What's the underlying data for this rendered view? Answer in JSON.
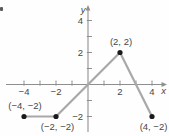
{
  "figure": {
    "description_label": "piecewise linear graph on coordinate plane"
  },
  "chart_data": {
    "type": "line",
    "title": "",
    "xlabel": "x",
    "ylabel": "y",
    "xlim": [
      -5,
      5
    ],
    "ylim": [
      -3.2,
      5
    ],
    "grid": false,
    "legend": false,
    "x_ticks": [
      -4,
      -3,
      -2,
      -1,
      1,
      2,
      3,
      4
    ],
    "y_ticks": [
      -2,
      -1,
      1,
      2,
      3,
      4
    ],
    "x_tick_labels": [
      {
        "v": -4,
        "t": "−4"
      },
      {
        "v": -2,
        "t": "−2"
      },
      {
        "v": 2,
        "t": "2"
      },
      {
        "v": 4,
        "t": "4"
      }
    ],
    "y_tick_labels": [
      {
        "v": 4,
        "t": "4"
      },
      {
        "v": 2,
        "t": "2"
      },
      {
        "v": -2,
        "t": "−2"
      }
    ],
    "series": [
      {
        "name": "piecewise-line",
        "x": [
          -4,
          -2,
          2,
          4
        ],
        "y": [
          -2,
          -2,
          2,
          -2
        ]
      }
    ],
    "points": [
      {
        "x": -4,
        "y": -2,
        "label": "(−4, −2)",
        "label_pos": "above"
      },
      {
        "x": -2,
        "y": -2,
        "label": "(−2, −2)",
        "label_pos": "below"
      },
      {
        "x": 2,
        "y": 2,
        "label": "(2, 2)",
        "label_pos": "above"
      },
      {
        "x": 4,
        "y": -2,
        "label": "(4, −2)",
        "label_pos": "below"
      }
    ],
    "colors": {
      "curve": "#a8a8a8",
      "axis": "#8f8f8f",
      "point": "#1a1a1a",
      "text": "#474747"
    }
  }
}
